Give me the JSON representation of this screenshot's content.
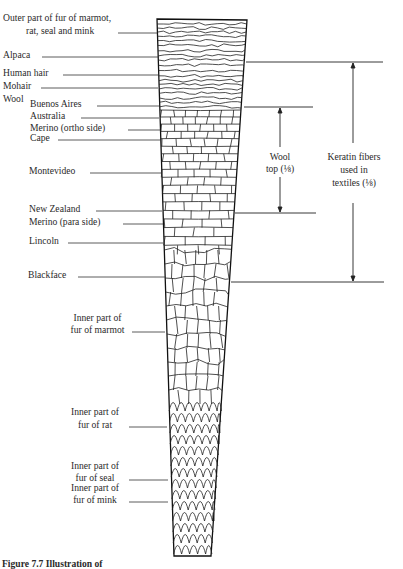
{
  "figure": {
    "labels": {
      "outer_fur": [
        "Outer part of fur of marmot,",
        "rat, seal and mink"
      ],
      "alpaca": "Alpaca",
      "human_hair": "Human hair",
      "mohair": "Mohair",
      "wool": "Wool",
      "buenos_aires": "Buenos Aires",
      "australia": "Australia",
      "merino_ortho": "Merino (ortho side)",
      "cape": "Cape",
      "montevideo": "Montevideo",
      "new_zealand": "New Zealand",
      "merino_para": "Merino (para side)",
      "lincoln": "Lincoln",
      "blackface": "Blackface",
      "inner_marmot": [
        "Inner part of",
        "fur of marmot"
      ],
      "inner_rat": [
        "Inner part of",
        "fur of rat"
      ],
      "inner_seal": [
        "Inner part of",
        "fur of seal"
      ],
      "inner_mink": [
        "Inner part of",
        "fur of mink"
      ]
    },
    "brackets": {
      "wool_top": [
        "Wool",
        "top (⅛)"
      ],
      "keratin": [
        "Keratin fibers",
        "used in",
        "textiles (⅛)"
      ]
    },
    "caption_partial": "Figure 7.7  Illustration of"
  }
}
